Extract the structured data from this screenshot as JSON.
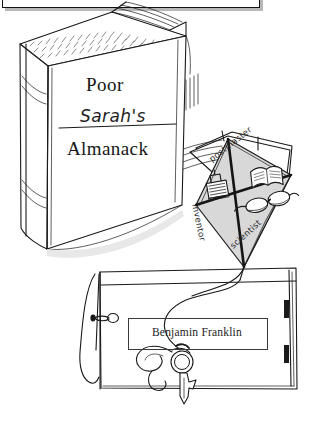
{
  "illustration": {
    "title": "Poor Sarah's Almanack",
    "description": "Pen-and-ink illustration of a standing book titled Poor Sarah's Almanack resting on a drawer, with a kite, key and papers",
    "palette": {
      "ink": "#1a1a1a",
      "paper": "#ffffff",
      "kite_fill": "#d9d9d9",
      "kite_fill_light": "#e6e6e6",
      "shadow": "#c9c9c9"
    }
  },
  "top_frame": {
    "name": "cropped-framed-box",
    "visible_text": ""
  },
  "book": {
    "cover_lines": [
      {
        "id": "line-1",
        "text": "Poor",
        "style": "serif"
      },
      {
        "id": "line-2",
        "text": "Sarah's",
        "style": "handwritten-struck"
      },
      {
        "id": "line-3",
        "text": "Almanack",
        "style": "serif"
      }
    ],
    "strikethrough_on": "Sarah's"
  },
  "kite": {
    "labels": [
      {
        "id": "q-top",
        "text": "postmaster"
      },
      {
        "id": "q-left",
        "text": "inventor"
      },
      {
        "id": "q-bottom",
        "text": "scientist"
      }
    ],
    "icons": [
      {
        "id": "printing-press-icon",
        "quadrant": "left"
      },
      {
        "id": "open-book-icon",
        "quadrant": "right"
      },
      {
        "id": "bifocal-glasses-icon",
        "quadrant": "bottom"
      }
    ]
  },
  "caption": {
    "text": "Benjamin Franklin"
  },
  "drawer": {
    "handle": "drawer-knob",
    "slots": 2
  },
  "key": {
    "name": "key-on-string",
    "has_ribbon": true
  }
}
